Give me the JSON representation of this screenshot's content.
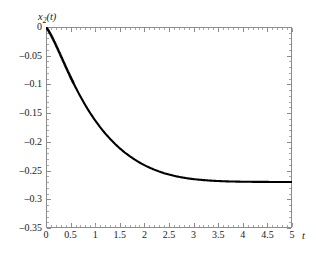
{
  "chart_data": {
    "type": "line",
    "title": "",
    "subtitle": "",
    "xlabel": "t",
    "ylabel": "x_2(t)",
    "ylabel_display": "x",
    "ylabel_sub": "2",
    "ylabel_tail": "(t)",
    "xlim": [
      0,
      5
    ],
    "ylim": [
      -0.35,
      0
    ],
    "grid": false,
    "legend": null,
    "xticks": [
      0,
      0.5,
      1,
      1.5,
      2,
      2.5,
      3,
      3.5,
      4,
      4.5,
      5
    ],
    "xticklabels": [
      "0",
      "0.5",
      "1",
      "1.5",
      "2",
      "2.5",
      "3",
      "3.5",
      "4",
      "4.5",
      "5"
    ],
    "yticks": [
      0,
      -0.05,
      -0.1,
      -0.15,
      -0.2,
      -0.25,
      -0.3,
      -0.35
    ],
    "yticklabels": [
      "0",
      "–0.05",
      "–0.1",
      "–0.15",
      "–0.2",
      "–0.25",
      "–0.3",
      "–0.35"
    ],
    "line_color": "#000000",
    "frame_color": "#8c8c8c",
    "annotations": [],
    "series": [
      {
        "name": "x2(t)",
        "style": "solid-with-dotted-start",
        "x": [
          0,
          0.05,
          0.1,
          0.15,
          0.2,
          0.25,
          0.3,
          0.35,
          0.4,
          0.45,
          0.5,
          0.55,
          0.6,
          0.65,
          0.7,
          0.75,
          0.8,
          0.85,
          0.9,
          0.95,
          1.0,
          1.1,
          1.2,
          1.3,
          1.4,
          1.5,
          1.6,
          1.7,
          1.8,
          1.9,
          2.0,
          2.1,
          2.2,
          2.3,
          2.4,
          2.5,
          2.6,
          2.7,
          2.8,
          2.9,
          3.0,
          3.2,
          3.4,
          3.6,
          3.8,
          4.0,
          4.2,
          4.4,
          4.6,
          4.8,
          5.0
        ],
        "values": [
          0,
          -0.0062,
          -0.0138,
          -0.0222,
          -0.0312,
          -0.0405,
          -0.05,
          -0.0595,
          -0.069,
          -0.0783,
          -0.0874,
          -0.0962,
          -0.1048,
          -0.1131,
          -0.1211,
          -0.1288,
          -0.1362,
          -0.1433,
          -0.1501,
          -0.1566,
          -0.1628,
          -0.1744,
          -0.185,
          -0.1946,
          -0.2034,
          -0.2113,
          -0.2185,
          -0.2249,
          -0.2307,
          -0.2359,
          -0.2406,
          -0.2447,
          -0.2484,
          -0.2516,
          -0.2545,
          -0.2569,
          -0.2591,
          -0.2609,
          -0.2625,
          -0.2638,
          -0.2649,
          -0.2666,
          -0.2678,
          -0.2686,
          -0.2691,
          -0.2694,
          -0.2696,
          -0.2697,
          -0.2698,
          -0.2698,
          -0.2698
        ]
      }
    ],
    "minimum": {
      "x": 2.4,
      "y": -0.285
    },
    "asymptote": -0.268
  }
}
